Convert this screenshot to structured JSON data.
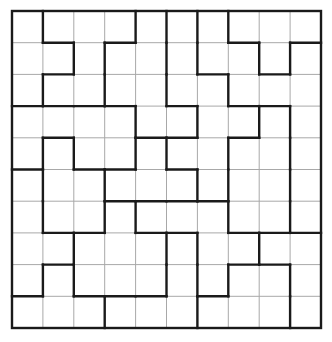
{
  "puzzle": {
    "rows": 10,
    "cols": 10,
    "origin": {
      "x": 12,
      "y": 11
    },
    "cell_width": 30.9,
    "cell_height": 31.7,
    "colors": {
      "background": "#ffffff",
      "thin_line": "#a8a8a8",
      "thick_line": "#1a1a1a"
    },
    "thick_vertical_segments_by_row": [
      [
        1,
        4,
        5,
        6,
        7
      ],
      [
        2,
        3,
        5,
        6,
        8,
        9
      ],
      [
        1,
        3,
        5,
        7
      ],
      [
        4,
        6,
        8,
        9
      ],
      [
        1,
        2,
        4,
        5,
        7,
        9
      ],
      [
        1,
        3,
        6,
        7,
        9
      ],
      [
        1,
        3,
        4,
        7,
        9
      ],
      [
        2,
        5,
        6,
        8
      ],
      [
        1,
        2,
        5,
        6,
        7,
        9
      ],
      [
        3,
        6,
        9
      ]
    ],
    "thick_horizontal_segments_by_line": {
      "1": [
        1,
        3,
        7,
        9
      ],
      "2": [
        1,
        6,
        8
      ],
      "3": [
        0,
        1,
        2,
        3,
        5,
        7,
        8
      ],
      "4": [
        1,
        4,
        5,
        7
      ],
      "5": [
        0,
        2,
        3,
        5
      ],
      "6": [
        3,
        4,
        5,
        6
      ],
      "7": [
        1,
        2,
        4,
        5,
        7,
        8,
        9
      ],
      "8": [
        1,
        7,
        8
      ],
      "9": [
        0,
        2,
        3,
        4,
        6
      ]
    }
  }
}
